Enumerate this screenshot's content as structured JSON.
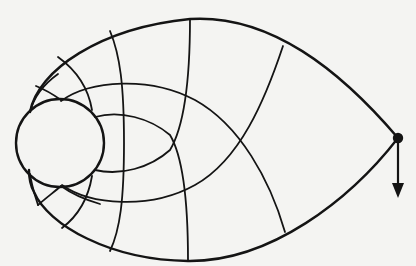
{
  "figure": {
    "type": "flow-net diagram",
    "colors": {
      "ink": "#141414",
      "paper": "#f4f4f2"
    },
    "elements": {
      "outer_boundary": "teardrop-outline",
      "inner_circle": "circle",
      "tip_point": "filled-dot",
      "arrow": "down-arrow-icon"
    }
  }
}
